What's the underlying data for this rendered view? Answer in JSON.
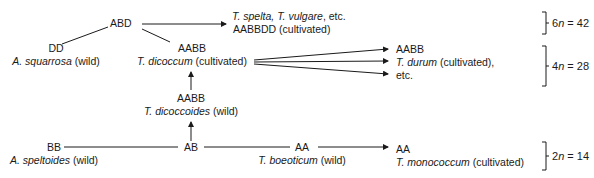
{
  "nodes": {
    "abd": {
      "genome": "ABD"
    },
    "spelta": {
      "species": "T. spelta, T. vulgare",
      "suffix": ", etc.",
      "genome": "AABBDD",
      "status": "(cultivated)"
    },
    "dd": {
      "genome": "DD",
      "species": "A. squarrosa",
      "status": "(wild)"
    },
    "dicoccum": {
      "genome": "AABB",
      "species": "T. dicoccum",
      "status": "(cultivated)"
    },
    "durum": {
      "genome": "AABB",
      "species": "T. durum",
      "status": "(cultivated),",
      "etc": "etc."
    },
    "dicoccoides": {
      "genome": "AABB",
      "species": "T. dicoccoides",
      "status": "(wild)"
    },
    "bb": {
      "genome": "BB",
      "species": "A. speltoides",
      "status": "(wild)"
    },
    "ab": {
      "genome": "AB"
    },
    "boeoticum": {
      "genome": "AA",
      "species": "T. boeoticum",
      "status": "(wild)"
    },
    "monococcum": {
      "genome": "AA",
      "species": "T. monococcum",
      "status": "(cultivated)"
    }
  },
  "ploidy": {
    "hexaploid": {
      "prefix": "6",
      "n": "n",
      "value": " = 42"
    },
    "tetraploid": {
      "prefix": "4",
      "n": "n",
      "value": " = 28"
    },
    "diploid": {
      "prefix": "2",
      "n": "n",
      "value": " = 14"
    }
  },
  "colors": {
    "ink": "#1a1a1a",
    "background": "#ffffff"
  }
}
